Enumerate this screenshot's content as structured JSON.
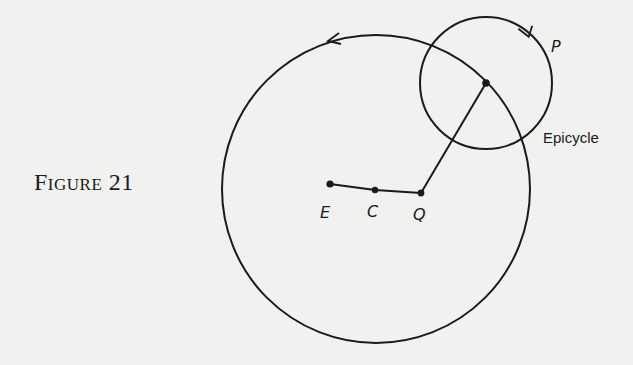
{
  "figure": {
    "caption": "Figure 21",
    "epicycle_label": "Epicycle",
    "points": {
      "E": "E",
      "C": "C",
      "Q": "Q",
      "P": "P"
    }
  },
  "diagram": {
    "deferent": {
      "cx": 376,
      "cy": 189,
      "r": 154,
      "direction": "counterclockwise"
    },
    "epicycle": {
      "cx": 486,
      "cy": 83,
      "r": 66,
      "direction": "counterclockwise"
    },
    "point_coords": {
      "E": [
        330,
        184
      ],
      "C": [
        375,
        190
      ],
      "Q": [
        421,
        193
      ],
      "epicycle_center": [
        486,
        83
      ]
    },
    "stroke_color": "#1a1a1a",
    "background": "#f1f1ef"
  }
}
